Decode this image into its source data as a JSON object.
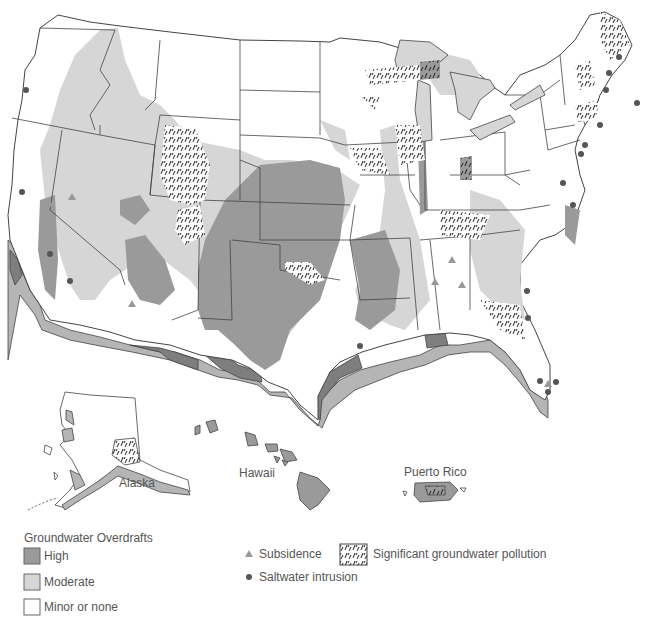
{
  "map": {
    "title": "Groundwater Overdrafts, Subsidence, Saltwater Intrusion and Pollution in the United States",
    "regions": {
      "contiguous_us": "Contiguous United States",
      "alaska": "Alaska",
      "hawaii": "Hawaii",
      "puerto_rico": "Puerto Rico"
    },
    "colors": {
      "high": "#9a9a9a",
      "moderate": "#d6d6d6",
      "minor": "#ffffff",
      "outline": "#444444",
      "coast_dark": "#7e7e7e",
      "coast_mid": "#b5b5b5",
      "symbol_triangle": "#999999",
      "symbol_dot": "#555555"
    }
  },
  "legend": {
    "overdrafts_title": "Groundwater Overdrafts",
    "overdrafts": [
      {
        "label": "High",
        "color": "#9a9a9a"
      },
      {
        "label": "Moderate",
        "color": "#d6d6d6"
      },
      {
        "label": "Minor or none",
        "color": "#ffffff"
      }
    ],
    "symbols": [
      {
        "label": "Subsidence",
        "icon": "triangle-icon"
      },
      {
        "label": "Saltwater intrusion",
        "icon": "dot-icon"
      }
    ],
    "pollution": {
      "label": "Significant groundwater pollution",
      "icon": "hatch-pattern-icon"
    }
  }
}
